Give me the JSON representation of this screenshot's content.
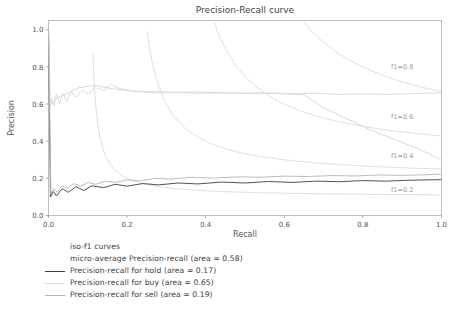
{
  "chart_data": {
    "type": "line",
    "title": "Precision-Recall curve",
    "xlabel": "Recall",
    "ylabel": "Precision",
    "xlim": [
      0.0,
      1.0
    ],
    "ylim": [
      0.0,
      1.05
    ],
    "grid": false,
    "legend_position": "below-axes-left",
    "xticks": [
      "0.0",
      "0.2",
      "0.4",
      "0.6",
      "0.8",
      "1.0"
    ],
    "xtick_values": [
      0.0,
      0.2,
      0.4,
      0.6,
      0.8,
      1.0
    ],
    "yticks": [
      "0.0",
      "0.2",
      "0.4",
      "0.6",
      "0.8",
      "1.0"
    ],
    "ytick_values": [
      0.0,
      0.2,
      0.4,
      0.6,
      0.8,
      1.0
    ],
    "annotations": [
      {
        "text": "f1=0.8",
        "x": 0.9,
        "y": 0.79,
        "color": "#a6a6a6"
      },
      {
        "text": "f1=0.6",
        "x": 0.9,
        "y": 0.52,
        "color": "#a6a6a6"
      },
      {
        "text": "f1=0.4",
        "x": 0.9,
        "y": 0.31,
        "color": "#a6a6a6"
      },
      {
        "text": "f1=0.2",
        "x": 0.9,
        "y": 0.125,
        "color": "#a6a6a6"
      }
    ],
    "iso_f1_levels": [
      0.2,
      0.4,
      0.6,
      0.8
    ],
    "iso_f1_color": "#cfcfcf",
    "series": [
      {
        "name": "iso-f1 curves",
        "legend_label": "iso-f1 curves",
        "color": "#cfcfcf",
        "linewidth": 0.7,
        "show_swatch": false,
        "x": [],
        "y": []
      },
      {
        "name": "micro-average Precision-recall",
        "legend_label": "micro-average Precision-recall (area = 0.58)",
        "area": 0.58,
        "color": "#d9d9d9",
        "linewidth": 1.0,
        "show_swatch": false,
        "x": [
          0.0,
          0.004,
          0.01,
          0.02,
          0.03,
          0.05,
          0.08,
          0.12,
          0.17,
          0.22,
          0.3,
          0.38,
          0.46,
          0.54,
          0.6,
          0.65,
          0.7,
          0.76,
          0.82,
          0.88,
          0.94,
          1.0
        ],
        "y": [
          1.0,
          0.62,
          0.6,
          0.63,
          0.64,
          0.66,
          0.69,
          0.7,
          0.68,
          0.67,
          0.665,
          0.665,
          0.66,
          0.66,
          0.655,
          0.65,
          0.58,
          0.52,
          0.46,
          0.41,
          0.36,
          0.3
        ]
      },
      {
        "name": "Precision-recall for hold",
        "legend_label": "Precision-recall for hold (area = 0.17)",
        "area": 0.17,
        "color": "#3f3f3f",
        "linewidth": 0.9,
        "show_swatch": true,
        "x": [
          0.0,
          0.005,
          0.012,
          0.02,
          0.035,
          0.05,
          0.07,
          0.09,
          0.11,
          0.14,
          0.17,
          0.2,
          0.24,
          0.28,
          0.33,
          0.38,
          0.44,
          0.5,
          0.56,
          0.62,
          0.68,
          0.74,
          0.8,
          0.86,
          0.92,
          1.0
        ],
        "y": [
          1.0,
          0.1,
          0.13,
          0.105,
          0.145,
          0.125,
          0.155,
          0.135,
          0.16,
          0.15,
          0.168,
          0.158,
          0.172,
          0.165,
          0.175,
          0.17,
          0.18,
          0.175,
          0.183,
          0.178,
          0.185,
          0.182,
          0.188,
          0.185,
          0.19,
          0.193
        ]
      },
      {
        "name": "Precision-recall for buy",
        "legend_label": "Precision-recall for buy (area = 0.65)",
        "area": 0.65,
        "color": "#dcdcdc",
        "linewidth": 1.0,
        "show_swatch": true,
        "x": [
          0.0,
          0.004,
          0.008,
          0.014,
          0.02,
          0.028,
          0.036,
          0.046,
          0.058,
          0.07,
          0.085,
          0.1,
          0.12,
          0.14,
          0.16,
          0.18,
          0.21,
          0.24,
          0.28,
          0.33,
          0.38,
          0.44,
          0.5,
          0.56,
          0.62,
          0.68,
          0.74,
          0.8,
          0.86,
          0.92,
          1.0
        ],
        "y": [
          1.0,
          0.58,
          0.63,
          0.59,
          0.655,
          0.6,
          0.66,
          0.615,
          0.665,
          0.635,
          0.675,
          0.655,
          0.69,
          0.67,
          0.705,
          0.685,
          0.67,
          0.665,
          0.66,
          0.662,
          0.658,
          0.66,
          0.657,
          0.659,
          0.656,
          0.658,
          0.652,
          0.655,
          0.652,
          0.656,
          0.66
        ]
      },
      {
        "name": "Precision-recall for sell",
        "legend_label": "Precision-recall for sell (area = 0.19)",
        "area": 0.19,
        "color": "#b4b4b4",
        "linewidth": 0.9,
        "show_swatch": true,
        "x": [
          0.0,
          0.006,
          0.013,
          0.022,
          0.034,
          0.048,
          0.064,
          0.082,
          0.1,
          0.12,
          0.145,
          0.17,
          0.2,
          0.235,
          0.27,
          0.31,
          0.36,
          0.42,
          0.48,
          0.54,
          0.6,
          0.66,
          0.72,
          0.78,
          0.84,
          0.9,
          0.95,
          1.0
        ],
        "y": [
          1.0,
          0.115,
          0.145,
          0.125,
          0.16,
          0.145,
          0.172,
          0.158,
          0.178,
          0.168,
          0.185,
          0.178,
          0.192,
          0.186,
          0.2,
          0.196,
          0.205,
          0.202,
          0.208,
          0.206,
          0.212,
          0.21,
          0.215,
          0.213,
          0.218,
          0.216,
          0.219,
          0.222
        ]
      }
    ]
  },
  "axes": {
    "title": "Precision-Recall curve",
    "xlabel": "Recall",
    "ylabel": "Precision"
  }
}
